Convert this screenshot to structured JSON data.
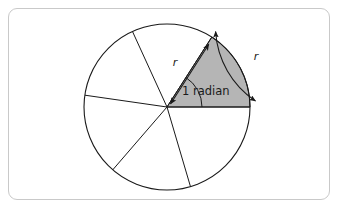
{
  "figure": {
    "kind": "geometry-diagram",
    "frame": {
      "border_color": "#c9c9c9",
      "background_color": "#ffffff",
      "corner_radius": 9
    },
    "circle": {
      "center_x": 167,
      "center_y": 107,
      "radius": 83,
      "stroke_color": "#1a1a1a",
      "fill_color": "#ffffff"
    },
    "shaded_sector": {
      "fill_color": "#b5b5b5",
      "stroke_color": "#1a1a1a",
      "start_angle_deg": 0,
      "end_angle_deg": 57.2958,
      "angle_label": "1 radian"
    },
    "spokes_deg": [
      0,
      57.2958,
      114.5916,
      171.8873,
      229.1831,
      286.4789
    ],
    "labels": {
      "radius_label": "r",
      "arc_label": "r",
      "angle_label": "1 radian"
    },
    "annotations": [
      {
        "name": "radius-measure-arrow",
        "text": "r",
        "description": "double-headed arrow along the radius marking length r"
      },
      {
        "name": "arc-length-measure-arrow",
        "text": "r",
        "description": "double-headed arc outside the circle marking arc length r"
      },
      {
        "name": "angle-arc",
        "text": "1 radian",
        "description": "small arc at the centre marking the one radian angle"
      }
    ]
  }
}
